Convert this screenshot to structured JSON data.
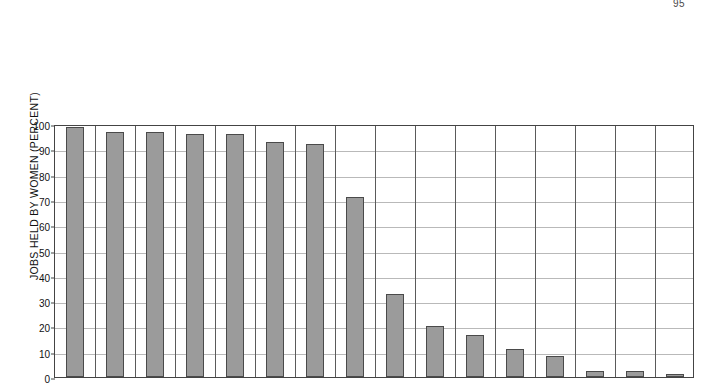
{
  "page": {
    "number": "95"
  },
  "chart_data": {
    "type": "bar",
    "title": "",
    "subtitle": "",
    "xlabel": "",
    "ylabel": "JOBS HELD BY WOMEN (PERCENT)",
    "ylim": [
      0,
      100
    ],
    "yticks": [
      0,
      10,
      20,
      30,
      40,
      50,
      60,
      70,
      80,
      90,
      100
    ],
    "ytick_labels": [
      "0",
      "10",
      "20",
      "30",
      "40",
      "50",
      "60",
      "70",
      "80",
      "90",
      "100"
    ],
    "grid": "horizontal-and-vertical",
    "legend": "none",
    "bar_color": "#9b9b9b",
    "bar_edge_color": "#4a4a4a",
    "categories": [
      "SECRETARIES",
      "CLEANERS AND SERVANTS",
      "PRACTICAL NURSES",
      "KEY-PUNCH OPERATORS",
      "SEWERS AND STITCHERS",
      "BANK TELLERS",
      "TELEPHONE OPERATORS",
      "RETAIL SALES CLERKS",
      "BANK OFFICIALS AND FINANCIAL MANAGERS",
      "CHEMISTS",
      "STOCK AND BOND SALES AGENTS",
      "SALES REPRESENTATIVES, WHOLESALE",
      "TELEPHONE INSTALLERS AND REPAIRERS",
      "CIVIL ENGINEERS",
      "MINE OPERATIVES",
      "ELECTRICIANS"
    ],
    "category_lines": [
      [
        "SECRETARIES"
      ],
      [
        "CLEANERS AND SERVANTS"
      ],
      [
        "PRACTICAL NURSES"
      ],
      [
        "KEY-PUNCH OPERATORS"
      ],
      [
        "SEWERS AND STITCHERS"
      ],
      [
        "BANK TELLERS"
      ],
      [
        "TELEPHONE OPERATORS"
      ],
      [
        "RETAIL SALES CLERKS"
      ],
      [
        "BANK OFFICIALS AND",
        "FINANCIAL MANAGERS"
      ],
      [
        "CHEMISTS"
      ],
      [
        "STOCK AND BOND",
        "SALES AGENTS"
      ],
      [
        "SALES REPRESENTATIVES,",
        "WHOLESALE"
      ],
      [
        "TELEPHONE INSTALLERS",
        "AND REPAIRERS"
      ],
      [
        "CIVIL ENGINEERS"
      ],
      [
        "MINE OPERATIVES"
      ],
      [
        "ELECTRICIANS"
      ]
    ],
    "values": [
      99,
      97,
      97,
      96,
      96,
      93,
      92,
      71,
      33,
      20,
      16.5,
      11,
      8.5,
      2.5,
      2.5,
      1
    ]
  }
}
